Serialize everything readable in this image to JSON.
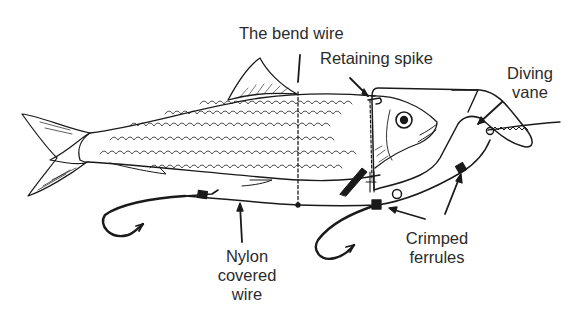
{
  "diagram": {
    "labels": {
      "bend_wire": "The bend wire",
      "retaining_spike": "Retaining spike",
      "diving_vane": [
        "Diving",
        "vane"
      ],
      "nylon_covered_wire": [
        "Nylon",
        "covered",
        "wire"
      ],
      "crimped_ferrules": [
        "Crimped",
        "ferrules"
      ]
    },
    "colors": {
      "ink": "#1a1a1a",
      "label_text": "#2b2b2b",
      "background": "#ffffff"
    }
  }
}
